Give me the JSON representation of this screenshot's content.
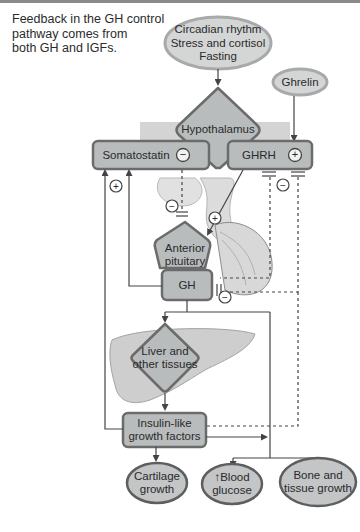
{
  "caption": {
    "lines": [
      "Feedback in the GH control",
      "pathway comes from",
      "both GH and IGFs."
    ]
  },
  "nodes": {
    "stimuli": {
      "lines": [
        "Circadian rhythm",
        "Stress and cortisol",
        "Fasting"
      ]
    },
    "ghrelin": {
      "label": "Ghrelin"
    },
    "hypothalamus": {
      "label": "Hypothalamus"
    },
    "somatostatin": {
      "label": "Somatostatin",
      "sign": "−"
    },
    "ghrh": {
      "label": "GHRH",
      "sign": "+"
    },
    "anterior_pituitary": {
      "lines": [
        "Anterior",
        "pituitary"
      ]
    },
    "gh": {
      "label": "GH"
    },
    "liver": {
      "lines": [
        "Liver and",
        "other tissues"
      ]
    },
    "igf": {
      "lines": [
        "Insulin-like",
        "growth factors"
      ]
    },
    "cartilage": {
      "lines": [
        "Cartilage",
        "growth"
      ]
    },
    "blood_glucose": {
      "lines": [
        "↑Blood",
        "glucose"
      ]
    },
    "bone": {
      "lines": [
        "Bone and",
        "tissue growth"
      ]
    }
  },
  "signs": {
    "plus": "+",
    "minus": "−"
  },
  "colors": {
    "node_fill": "#b9bcbd",
    "node_border": "#6b6b6b",
    "oval_fill": "#d4d6d6",
    "oval_border": "#a7a9aa",
    "outcome_fill": "#c3c5c6",
    "outcome_border": "#5e5e5e",
    "tissue": "#cfd0cf",
    "line": "#555555"
  }
}
